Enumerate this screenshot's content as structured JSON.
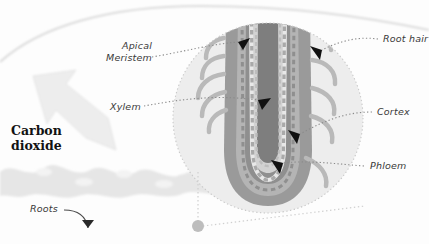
{
  "figure": {
    "background_color": "#fdfdfd"
  },
  "emphasis": {
    "carbon_dioxide_line1": "Carbon",
    "carbon_dioxide_line2": "dioxide",
    "color": "#121212"
  },
  "labels": {
    "apical_meristem_line1": "Apical",
    "apical_meristem_line2": "Meristem",
    "xylem": "Xylem",
    "roots": "Roots",
    "root_hair": "Root hair",
    "cortex": "Cortex",
    "phloem": "Phloem",
    "text_color": "#3a3a3a"
  },
  "palette": {
    "epidermis": "#9a9a9a",
    "cortex_band": "#b4b4b4",
    "stele_outer": "#8f8f8f",
    "stele_core": "#7e7e7e",
    "pale_inner": "#d2d2d2",
    "magnifier_fill": "#ededed",
    "magnifier_stroke": "#c9c9c9",
    "soil_band": "#e6e6e6",
    "big_arrow": "#ededed",
    "leader_line": "#8a8a8a",
    "arrowhead": "#111111"
  }
}
